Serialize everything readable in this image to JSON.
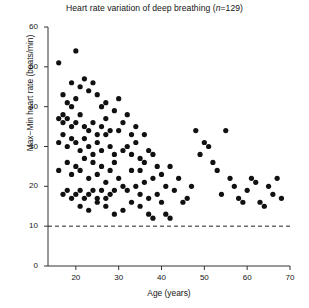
{
  "chart_data": {
    "type": "scatter",
    "title": "Heart rate variation of deep breathing (n=129)",
    "title_prefix": "Heart rate variation of deep breathing (",
    "title_italic": "n",
    "title_suffix": "=129)",
    "xlabel": "Age (years)",
    "ylabel": "Max−Min heart rate (beats/min)",
    "xlim": [
      13.5,
      70
    ],
    "ylim": [
      0,
      60
    ],
    "xticks": [
      20,
      30,
      40,
      50,
      60,
      70
    ],
    "yticks": [
      0,
      10,
      20,
      30,
      40,
      50,
      60
    ],
    "grid": false,
    "legend": null,
    "n": 129,
    "marker": "filled-circle",
    "marker_color": "#111111",
    "marker_size": 2.6,
    "reference_line": {
      "y": 10,
      "style": "dashed",
      "color": "#222222",
      "label": ""
    },
    "points": [
      [
        16,
        51
      ],
      [
        20,
        54
      ],
      [
        17,
        43
      ],
      [
        19,
        46
      ],
      [
        21,
        45
      ],
      [
        18,
        41
      ],
      [
        17,
        38
      ],
      [
        19,
        40
      ],
      [
        20,
        42
      ],
      [
        22,
        47
      ],
      [
        23,
        44
      ],
      [
        24,
        46
      ],
      [
        25,
        43
      ],
      [
        26,
        40
      ],
      [
        27,
        41
      ],
      [
        16,
        37
      ],
      [
        17,
        36
      ],
      [
        18,
        37
      ],
      [
        19,
        35
      ],
      [
        20,
        36
      ],
      [
        21,
        38
      ],
      [
        22,
        35
      ],
      [
        23,
        34
      ],
      [
        24,
        36
      ],
      [
        25,
        33
      ],
      [
        26,
        35
      ],
      [
        27,
        37
      ],
      [
        28,
        34
      ],
      [
        29,
        39
      ],
      [
        30,
        42
      ],
      [
        16,
        31
      ],
      [
        17,
        33
      ],
      [
        18,
        30
      ],
      [
        19,
        32
      ],
      [
        20,
        31
      ],
      [
        21,
        29
      ],
      [
        22,
        32
      ],
      [
        23,
        30
      ],
      [
        24,
        28
      ],
      [
        25,
        31
      ],
      [
        26,
        29
      ],
      [
        27,
        33
      ],
      [
        28,
        30
      ],
      [
        29,
        28
      ],
      [
        30,
        34
      ],
      [
        16,
        24
      ],
      [
        18,
        26
      ],
      [
        19,
        23
      ],
      [
        20,
        25
      ],
      [
        21,
        24
      ],
      [
        22,
        27
      ],
      [
        23,
        22
      ],
      [
        24,
        26
      ],
      [
        25,
        23
      ],
      [
        26,
        25
      ],
      [
        27,
        21
      ],
      [
        28,
        24
      ],
      [
        29,
        26
      ],
      [
        30,
        22
      ],
      [
        31,
        29
      ],
      [
        31,
        36
      ],
      [
        32,
        38
      ],
      [
        33,
        33
      ],
      [
        34,
        35
      ],
      [
        32,
        30
      ],
      [
        33,
        28
      ],
      [
        34,
        31
      ],
      [
        35,
        27
      ],
      [
        36,
        33
      ],
      [
        35,
        24
      ],
      [
        36,
        26
      ],
      [
        37,
        29
      ],
      [
        38,
        22
      ],
      [
        31,
        20
      ],
      [
        32,
        19
      ],
      [
        33,
        24
      ],
      [
        34,
        20
      ],
      [
        35,
        18
      ],
      [
        36,
        21
      ],
      [
        37,
        17
      ],
      [
        29,
        19
      ],
      [
        28,
        18
      ],
      [
        27,
        17
      ],
      [
        26,
        19
      ],
      [
        25,
        17
      ],
      [
        24,
        19
      ],
      [
        23,
        18
      ],
      [
        22,
        17
      ],
      [
        21,
        19
      ],
      [
        20,
        18
      ],
      [
        19,
        17
      ],
      [
        18,
        19
      ],
      [
        17,
        18
      ],
      [
        21,
        15
      ],
      [
        23,
        14
      ],
      [
        25,
        16
      ],
      [
        27,
        15
      ],
      [
        29,
        13
      ],
      [
        31,
        14
      ],
      [
        33,
        16
      ],
      [
        35,
        15
      ],
      [
        37,
        13
      ],
      [
        38,
        12
      ],
      [
        39,
        18
      ],
      [
        40,
        16
      ],
      [
        41,
        13
      ],
      [
        42,
        12
      ],
      [
        40,
        23
      ],
      [
        41,
        20
      ],
      [
        42,
        25
      ],
      [
        43,
        19
      ],
      [
        44,
        22
      ],
      [
        38,
        28
      ],
      [
        39,
        25
      ],
      [
        45,
        16
      ],
      [
        46,
        17
      ],
      [
        47,
        20
      ],
      [
        48,
        34
      ],
      [
        49,
        28
      ],
      [
        50,
        31
      ],
      [
        51,
        30
      ],
      [
        52,
        26
      ],
      [
        53,
        24
      ],
      [
        54,
        18
      ],
      [
        55,
        34
      ],
      [
        56,
        22
      ],
      [
        57,
        20
      ],
      [
        58,
        17
      ],
      [
        59,
        16
      ],
      [
        60,
        19
      ],
      [
        61,
        22
      ],
      [
        62,
        21
      ],
      [
        63,
        16
      ],
      [
        64,
        15
      ],
      [
        65,
        20
      ],
      [
        66,
        18
      ],
      [
        67,
        22
      ],
      [
        68,
        17
      ]
    ]
  }
}
